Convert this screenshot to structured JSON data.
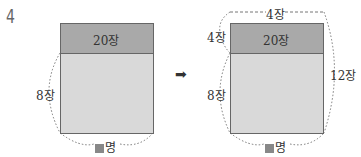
{
  "problem_number": "4",
  "left_diagram": {
    "top_label": "20장",
    "side_label": "8장",
    "bottom_label": "명",
    "bottom_marker": "■"
  },
  "arrow": "➡",
  "right_diagram": {
    "top_label": "20장",
    "over_top_label": "4장",
    "left_top_label": "4장",
    "left_bottom_label": "8장",
    "right_label": "12장",
    "bottom_label": "명",
    "bottom_marker": "■"
  },
  "colors": {
    "dark_fill": "#a9a9a9",
    "light_fill": "#d9d9d9",
    "border": "#666666"
  }
}
